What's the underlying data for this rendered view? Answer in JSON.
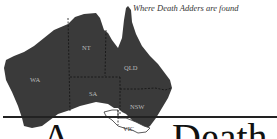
{
  "map": {
    "caption": "Where Death Adders are found",
    "regions": [
      {
        "label": "WA",
        "shaded": true
      },
      {
        "label": "NT",
        "shaded": true
      },
      {
        "label": "QLD",
        "shaded": true
      },
      {
        "label": "SA",
        "shaded": true
      },
      {
        "label": "NSW",
        "shaded": true
      },
      {
        "label": "VIC",
        "shaded": false
      }
    ],
    "colors": {
      "shaded": "#3a3a3a",
      "unshaded": "#ffffff",
      "border": "#111111"
    }
  },
  "heading": {
    "part1": "A",
    "part2": "Death"
  }
}
